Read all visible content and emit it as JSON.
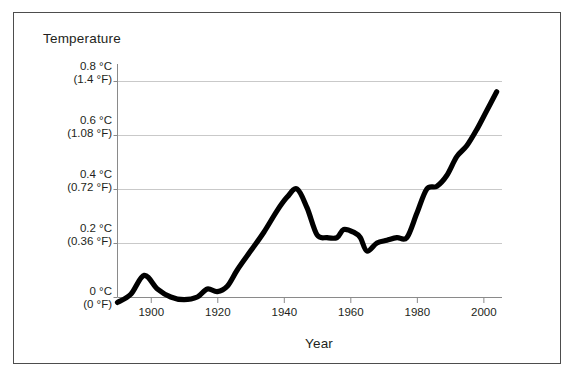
{
  "chart_data": {
    "type": "line",
    "title": "",
    "xlabel": "Year",
    "ylabel": "Temperature",
    "xlim": [
      1890,
      2005
    ],
    "ylim": [
      -0.05,
      0.85
    ],
    "grid": true,
    "legend": "none",
    "x_ticks": [
      "1900",
      "1920",
      "1940",
      "1960",
      "1980",
      "2000"
    ],
    "x_tick_values": [
      1900,
      1920,
      1940,
      1960,
      1980,
      2000
    ],
    "y_ticks": [
      {
        "celsius": "0.8 °C",
        "fahrenheit": "(1.4 °F)",
        "value": 0.8
      },
      {
        "celsius": "0.6 °C",
        "fahrenheit": "(1.08 °F)",
        "value": 0.6
      },
      {
        "celsius": "0.4 °C",
        "fahrenheit": "(0.72 °F)",
        "value": 0.4
      },
      {
        "celsius": "0.2 °C",
        "fahrenheit": "(0.36 °F)",
        "value": 0.2
      },
      {
        "celsius": "0 °C",
        "fahrenheit": "(0 °F)",
        "value": 0
      }
    ],
    "series": [
      {
        "name": "Global temperature anomaly",
        "color": "#000000",
        "x": [
          1890,
          1894,
          1898,
          1902,
          1906,
          1910,
          1914,
          1917,
          1920,
          1923,
          1926,
          1930,
          1934,
          1938,
          1941,
          1944,
          1947,
          1950,
          1953,
          1956,
          1958,
          1961,
          1963,
          1965,
          1968,
          1971,
          1974,
          1977,
          1980,
          1983,
          1986,
          1989,
          1992,
          1995,
          1998,
          2001,
          2004
        ],
        "y": [
          -0.02,
          0.01,
          0.08,
          0.03,
          0.0,
          -0.01,
          0.0,
          0.03,
          0.02,
          0.04,
          0.1,
          0.17,
          0.24,
          0.32,
          0.37,
          0.4,
          0.33,
          0.23,
          0.22,
          0.22,
          0.25,
          0.24,
          0.22,
          0.17,
          0.2,
          0.21,
          0.22,
          0.22,
          0.31,
          0.4,
          0.41,
          0.45,
          0.52,
          0.56,
          0.62,
          0.69,
          0.76
        ]
      }
    ]
  },
  "axis_titles": {
    "temperature": "Temperature",
    "year": "Year"
  },
  "colors": {
    "line": "#000000",
    "grid": "#c9c9c9",
    "axis": "#8a8a8a",
    "frame": "#4d4d4d",
    "text": "#231f20"
  }
}
